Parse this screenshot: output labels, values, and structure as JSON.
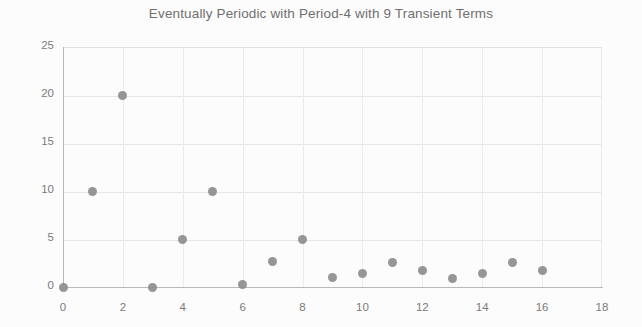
{
  "chart_data": {
    "type": "scatter",
    "title": "Eventually Periodic with Period-4 with 9 Transient Terms",
    "xlabel": "",
    "ylabel": "",
    "x": [
      0,
      1,
      2,
      3,
      4,
      5,
      6,
      7,
      8,
      9,
      10,
      11,
      12,
      13,
      14,
      15,
      16
    ],
    "values": [
      0,
      10,
      20,
      0,
      5,
      10,
      0.3,
      2.7,
      5,
      1.0,
      1.4,
      2.6,
      1.7,
      0.9,
      1.4,
      2.6,
      1.7
    ],
    "xlim": [
      0,
      18
    ],
    "ylim": [
      0,
      25
    ],
    "xticks": [
      0,
      2,
      4,
      6,
      8,
      10,
      12,
      14,
      16,
      18
    ],
    "yticks": [
      0,
      5,
      10,
      15,
      20,
      25
    ],
    "xtick_labels": [
      "0",
      "2",
      "4",
      "6",
      "8",
      "10",
      "12",
      "14",
      "16",
      "18"
    ],
    "ytick_labels": [
      "0",
      "5",
      "10",
      "15",
      "20",
      "25"
    ],
    "grid": true,
    "legend": false,
    "marker_color": "#8d8d8d",
    "grid_color": "#e6e6e6",
    "axis_color": "#b9b9b9",
    "text_color": "#7b7b7b"
  }
}
